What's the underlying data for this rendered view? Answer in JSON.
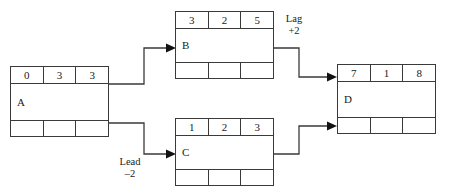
{
  "diagram": {
    "line_color": "#3a3a3a",
    "text_color": "#1a1a1a",
    "background": "#ffffff"
  },
  "nodes": [
    {
      "id": "A",
      "label": "A",
      "top_cells": [
        "0",
        "3",
        "3"
      ],
      "bottom_cells": [
        "",
        "",
        ""
      ]
    },
    {
      "id": "B",
      "label": "B",
      "top_cells": [
        "3",
        "2",
        "5"
      ],
      "bottom_cells": [
        "",
        "",
        ""
      ]
    },
    {
      "id": "C",
      "label": "C",
      "top_cells": [
        "1",
        "2",
        "3"
      ],
      "bottom_cells": [
        "",
        "",
        ""
      ]
    },
    {
      "id": "D",
      "label": "D",
      "top_cells": [
        "7",
        "1",
        "8"
      ],
      "bottom_cells": [
        "",
        "",
        ""
      ]
    }
  ],
  "edge_labels": {
    "lag": "Lag\n+2",
    "lead": "Lead\n–2"
  }
}
